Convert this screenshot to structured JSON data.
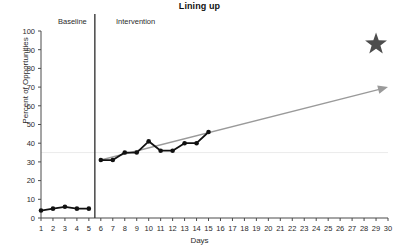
{
  "chart_data": {
    "type": "line",
    "title": "Lining up",
    "xlabel": "Days",
    "ylabel": "Percent of Opportunities",
    "ylim": [
      0,
      100
    ],
    "xlim": [
      1,
      30
    ],
    "ytick_step": 10,
    "yticks": [
      0,
      10,
      20,
      30,
      40,
      50,
      60,
      70,
      80,
      90,
      100
    ],
    "xticks": [
      1,
      2,
      3,
      4,
      5,
      6,
      7,
      8,
      9,
      10,
      11,
      12,
      13,
      14,
      15,
      16,
      17,
      18,
      19,
      20,
      21,
      22,
      23,
      24,
      25,
      26,
      27,
      28,
      29,
      30
    ],
    "grid": "single faint horizontal gridline near 35",
    "gridline_value": 35,
    "legend": "none",
    "phases": [
      {
        "name": "Baseline",
        "label": "Baseline",
        "days": [
          1,
          5
        ]
      },
      {
        "name": "Intervention",
        "label": "Intervention",
        "days": [
          6,
          30
        ]
      }
    ],
    "phase_change_line": {
      "between_days": [
        5,
        6
      ],
      "color": "#3a3a3a"
    },
    "series": [
      {
        "name": "Baseline",
        "color": "#111111",
        "marker": "filled-circle",
        "x": [
          1,
          2,
          3,
          4,
          5
        ],
        "values": [
          4,
          5,
          6,
          5,
          5
        ]
      },
      {
        "name": "Intervention",
        "color": "#111111",
        "marker": "filled-circle",
        "x": [
          6,
          7,
          8,
          9,
          10,
          11,
          12,
          13,
          14,
          15
        ],
        "values": [
          31,
          31,
          35,
          35,
          41,
          36,
          36,
          40,
          40,
          46
        ]
      }
    ],
    "annotations": [
      {
        "type": "trend-arrow",
        "name": "projected-trend-arrow",
        "color": "#9a9a9a",
        "from": {
          "x": 6,
          "y": 31
        },
        "to": {
          "x": 30,
          "y": 70
        }
      },
      {
        "type": "star",
        "name": "goal-star",
        "color": "#4d4d4d",
        "at": {
          "x": 29,
          "y": 93
        }
      }
    ]
  },
  "colors": {
    "data_line": "#111111",
    "trend_arrow": "#9a9a9a",
    "star": "#4d4d4d",
    "axis": "#4a4a4a",
    "phase_line": "#3a3a3a",
    "gridline": "#ececec",
    "background": "#ffffff"
  }
}
